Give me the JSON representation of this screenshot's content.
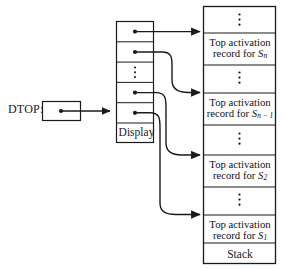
{
  "figure": {
    "pointer_box": {
      "label": "DTOP:",
      "name": "dtop-pointer-box"
    },
    "display": {
      "label": "Display",
      "cells": [
        {
          "index": 0,
          "content": "pointer",
          "target": "stack_cell_1"
        },
        {
          "index": 1,
          "content": "pointer",
          "target": "stack_cell_3"
        },
        {
          "index": 2,
          "content": "vertical-dots",
          "target": null
        },
        {
          "index": 3,
          "content": "pointer",
          "target": "stack_cell_5"
        },
        {
          "index": 4,
          "content": "pointer",
          "target": "stack_cell_7"
        },
        {
          "index": 5,
          "content": "label",
          "target": null
        }
      ]
    },
    "stack": {
      "label": "Stack",
      "cells": [
        {
          "id": "stack_cell_0",
          "type": "vertical-dots",
          "text": ""
        },
        {
          "id": "stack_cell_1",
          "type": "record",
          "line1": "Top activation",
          "line2": "record for ",
          "subject": "S",
          "subscript": "n"
        },
        {
          "id": "stack_cell_2",
          "type": "vertical-dots",
          "text": ""
        },
        {
          "id": "stack_cell_3",
          "type": "record",
          "line1": "Top activation",
          "line2": "record for ",
          "subject": "S",
          "subscript": "n − 1"
        },
        {
          "id": "stack_cell_4",
          "type": "vertical-dots",
          "text": ""
        },
        {
          "id": "stack_cell_5",
          "type": "record",
          "line1": "Top activation",
          "line2": "record for ",
          "subject": "S",
          "subscript": "2"
        },
        {
          "id": "stack_cell_6",
          "type": "vertical-dots",
          "text": ""
        },
        {
          "id": "stack_cell_7",
          "type": "record",
          "line1": "Top activation",
          "line2": "record for ",
          "subject": "S",
          "subscript": "1"
        },
        {
          "id": "stack_cell_8",
          "type": "label",
          "text": "Stack"
        }
      ]
    },
    "colors": {
      "line": "#1a1a1a",
      "text": "#111111",
      "background": "#ffffff"
    }
  }
}
